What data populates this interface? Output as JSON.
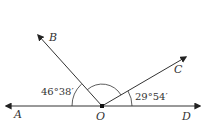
{
  "diagram": {
    "points": {
      "A": "A",
      "B": "B",
      "C": "C",
      "D": "D",
      "O": "O"
    },
    "angles": {
      "AOB": "46°38′",
      "COD": "29°54′"
    },
    "colors": {
      "line": "#333333",
      "background": "#ffffff"
    }
  }
}
